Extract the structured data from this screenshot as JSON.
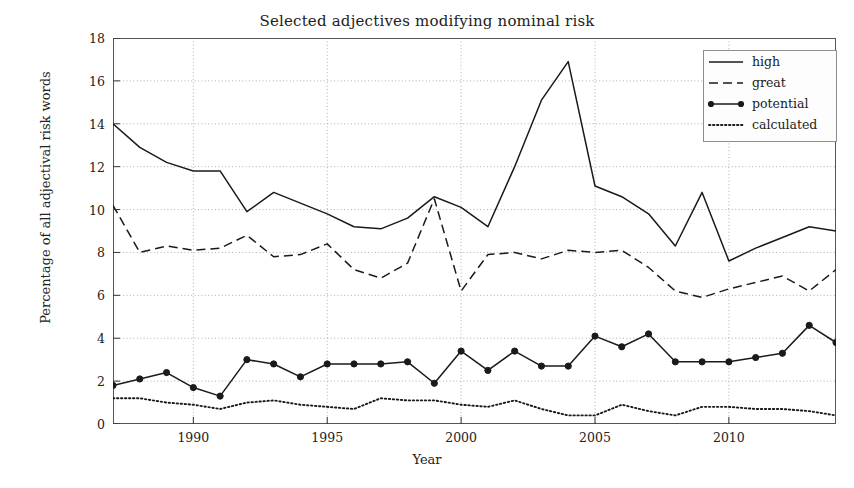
{
  "chart_data": {
    "type": "line",
    "title": "Selected adjectives modifying nominal risk",
    "xlabel": "Year",
    "ylabel": "Percentage of all adjectival risk words",
    "xlim": [
      1987,
      2014
    ],
    "ylim": [
      0,
      18
    ],
    "yticks": [
      0,
      2,
      4,
      6,
      8,
      10,
      12,
      14,
      16,
      18
    ],
    "xticks": [
      1990,
      1995,
      2000,
      2005,
      2010
    ],
    "grid": true,
    "legend_position": "top-right",
    "x": [
      1987,
      1988,
      1989,
      1990,
      1991,
      1992,
      1993,
      1994,
      1995,
      1996,
      1997,
      1998,
      1999,
      2000,
      2001,
      2002,
      2003,
      2004,
      2005,
      2006,
      2007,
      2008,
      2009,
      2010,
      2011,
      2012,
      2013,
      2014
    ],
    "series": [
      {
        "name": "high",
        "style": "solid",
        "marker": "none",
        "color": "#1a1a1a",
        "values": [
          14.0,
          12.9,
          12.2,
          11.8,
          11.8,
          9.9,
          10.8,
          10.3,
          9.8,
          9.2,
          9.1,
          9.6,
          10.6,
          10.1,
          9.2,
          12.0,
          15.1,
          16.9,
          11.1,
          10.6,
          9.8,
          8.3,
          10.8,
          7.6,
          8.2,
          8.7,
          9.2,
          9.0
        ]
      },
      {
        "name": "great",
        "style": "dashed",
        "marker": "none",
        "color": "#1a1a1a",
        "values": [
          10.2,
          8.0,
          8.3,
          8.1,
          8.2,
          8.8,
          7.8,
          7.9,
          8.4,
          7.2,
          6.8,
          7.5,
          10.5,
          6.2,
          7.9,
          8.0,
          7.7,
          8.1,
          8.0,
          8.1,
          7.3,
          6.2,
          5.9,
          6.3,
          6.6,
          6.9,
          6.2,
          7.2
        ]
      },
      {
        "name": "potential",
        "style": "solid",
        "marker": "circle",
        "color": "#1a1a1a",
        "values": [
          1.8,
          2.1,
          2.4,
          1.7,
          1.3,
          3.0,
          2.8,
          2.2,
          2.8,
          2.8,
          2.8,
          2.9,
          1.9,
          3.4,
          2.5,
          3.4,
          2.7,
          2.7,
          4.1,
          3.6,
          4.2,
          2.9,
          2.9,
          2.9,
          3.1,
          3.3,
          4.6,
          3.8
        ]
      },
      {
        "name": "calculated",
        "style": "dotted",
        "marker": "none",
        "color": "#1a1a1a",
        "values": [
          1.2,
          1.2,
          1.0,
          0.9,
          0.7,
          1.0,
          1.1,
          0.9,
          0.8,
          0.7,
          1.2,
          1.1,
          1.1,
          0.9,
          0.8,
          1.1,
          0.7,
          0.4,
          0.4,
          0.9,
          0.6,
          0.4,
          0.8,
          0.8,
          0.7,
          0.7,
          0.6,
          0.4
        ]
      }
    ]
  },
  "legend": {
    "items": [
      {
        "label": "high"
      },
      {
        "label": "great"
      },
      {
        "label": "potential"
      },
      {
        "label": "calculated"
      }
    ]
  }
}
